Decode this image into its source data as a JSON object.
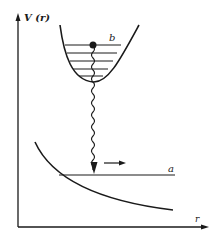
{
  "diagram": {
    "y_axis_label": "V (r)",
    "x_axis_label": "r",
    "upper_state_label": "b",
    "lower_state_label": "a",
    "vibrational_levels": 5,
    "colors": {
      "ink": "#1a1a1a",
      "background": "#ffffff"
    }
  }
}
